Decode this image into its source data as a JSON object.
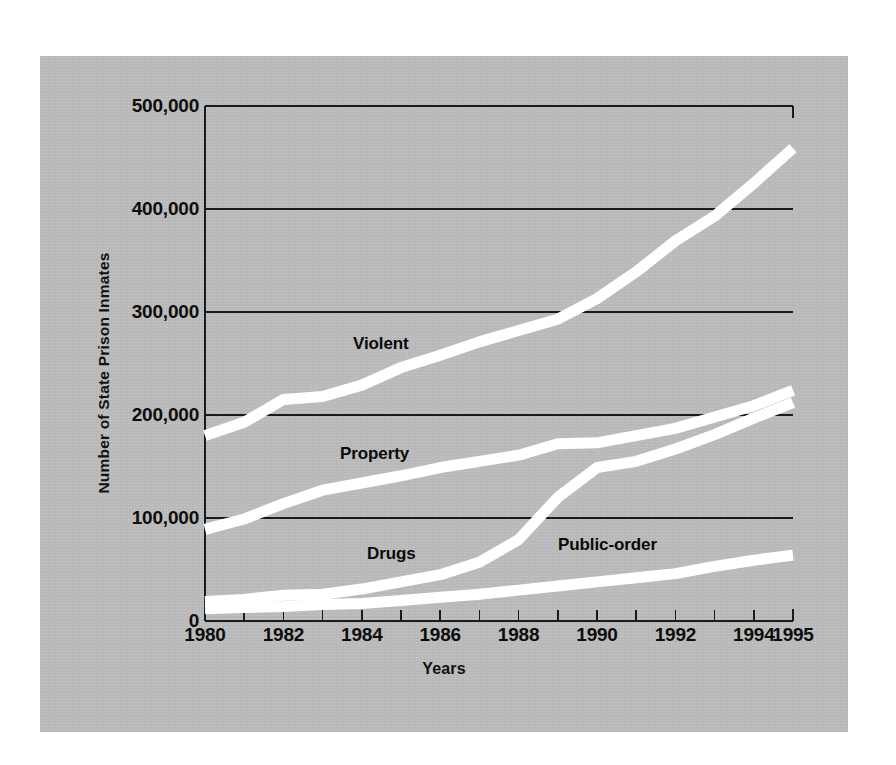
{
  "chart_data": {
    "type": "line",
    "title": "",
    "subtitle": "",
    "xlabel": "Years",
    "ylabel": "Number of State Prison Inmates",
    "xlim": [
      1980,
      1995
    ],
    "ylim": [
      0,
      500000
    ],
    "grid": true,
    "gridlines_y": [
      0,
      100000,
      200000,
      300000,
      400000,
      500000
    ],
    "legend_position": "inline-labels",
    "background_color": "#b9b9b9",
    "line_color": "#ffffff",
    "axis_color": "#1a1a1a",
    "x": [
      1980,
      1981,
      1982,
      1983,
      1984,
      1985,
      1986,
      1987,
      1988,
      1989,
      1990,
      1991,
      1992,
      1993,
      1994,
      1995
    ],
    "x_tick_labels": [
      "1980",
      "1982",
      "1984",
      "1986",
      "1988",
      "1990",
      "1992",
      "1994",
      "1995"
    ],
    "x_tick_values": [
      1980,
      1982,
      1984,
      1986,
      1988,
      1990,
      1992,
      1994,
      1995
    ],
    "y_tick_labels": [
      "500,000",
      "400,000",
      "300,000",
      "200,000",
      "100,000",
      "0"
    ],
    "y_tick_values": [
      500000,
      400000,
      300000,
      200000,
      100000,
      0
    ],
    "series": [
      {
        "name": "Violent",
        "label": "Violent",
        "values": [
          180000,
          193000,
          215000,
          218000,
          229000,
          246000,
          258000,
          271000,
          282000,
          293000,
          313000,
          339000,
          369000,
          393000,
          425000,
          459000
        ]
      },
      {
        "name": "Property",
        "label": "Property",
        "values": [
          89000,
          99000,
          114000,
          127000,
          134000,
          141000,
          149000,
          155000,
          161000,
          172000,
          173000,
          180000,
          187000,
          198000,
          209000,
          224000
        ]
      },
      {
        "name": "Drugs",
        "label": "Drugs",
        "values": [
          19000,
          21000,
          25000,
          26000,
          31000,
          38000,
          45000,
          57000,
          79000,
          120000,
          149000,
          155000,
          167000,
          181000,
          197000,
          212000
        ]
      },
      {
        "name": "Public-order",
        "label": "Public-order",
        "values": [
          12000,
          13000,
          14000,
          16000,
          17000,
          20000,
          23000,
          26000,
          30000,
          34000,
          38000,
          42000,
          46000,
          53000,
          59000,
          64000
        ]
      }
    ]
  },
  "axes": {
    "y_title": "Number of State Prison Inmates",
    "x_title": "Years"
  }
}
